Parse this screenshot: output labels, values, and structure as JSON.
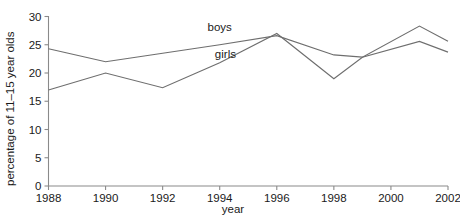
{
  "chart_data": {
    "type": "line",
    "title": "",
    "xlabel": "year",
    "ylabel": "percentage of 11–15 year olds",
    "xlim": [
      1988,
      2002
    ],
    "ylim": [
      0,
      30
    ],
    "grid": false,
    "legend_position": "inline",
    "x_ticks": [
      "1988",
      "1990",
      "1992",
      "1994",
      "1996",
      "1998",
      "2000",
      "2002"
    ],
    "y_ticks": [
      "0",
      "5",
      "10",
      "15",
      "20",
      "25",
      "30"
    ],
    "x": [
      1988,
      1990,
      1992,
      1994,
      1996,
      1998,
      1999,
      2001,
      2002
    ],
    "series": [
      {
        "name": "boys",
        "label": "boys",
        "color": "#6e6e6e",
        "values": [
          24.3,
          22.0,
          23.5,
          25.0,
          26.6,
          23.2,
          22.8,
          28.3,
          25.6
        ]
      },
      {
        "name": "girls",
        "label": "girls",
        "color": "#6e6e6e",
        "values": [
          17.0,
          20.0,
          17.4,
          21.8,
          27.0,
          19.0,
          22.8,
          25.6,
          23.7
        ]
      }
    ],
    "annotations": [
      {
        "text": "boys",
        "x": 1994.0,
        "y": 28.2
      },
      {
        "text": "girls",
        "x": 1994.2,
        "y": 23.4
      }
    ]
  }
}
